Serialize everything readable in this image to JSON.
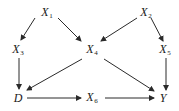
{
  "diagram": {
    "type": "causal-dag",
    "colors": {
      "edge": "#2a2a2a",
      "text": "#1a1a1a",
      "background": "#ffffff"
    },
    "nodes": [
      {
        "id": "X1",
        "base": "X",
        "sub": "1",
        "x": 47,
        "y": 13
      },
      {
        "id": "X2",
        "base": "X",
        "sub": "2",
        "x": 146,
        "y": 13
      },
      {
        "id": "X3",
        "base": "X",
        "sub": "3",
        "x": 18,
        "y": 50
      },
      {
        "id": "X4",
        "base": "X",
        "sub": "4",
        "x": 92,
        "y": 50
      },
      {
        "id": "X5",
        "base": "X",
        "sub": "5",
        "x": 165,
        "y": 50
      },
      {
        "id": "D",
        "base": "D",
        "sub": "",
        "x": 18,
        "y": 98
      },
      {
        "id": "X6",
        "base": "X",
        "sub": "6",
        "x": 92,
        "y": 98
      },
      {
        "id": "Y",
        "base": "Y",
        "sub": "",
        "x": 163,
        "y": 98
      }
    ],
    "edges": [
      {
        "from": "X1",
        "to": "X3",
        "x1": 35,
        "y1": 18,
        "x2": 21,
        "y2": 40
      },
      {
        "from": "X1",
        "to": "X4",
        "x1": 58,
        "y1": 18,
        "x2": 81,
        "y2": 41
      },
      {
        "from": "X2",
        "to": "X4",
        "x1": 137,
        "y1": 18,
        "x2": 101,
        "y2": 41
      },
      {
        "from": "X2",
        "to": "X5",
        "x1": 151,
        "y1": 18,
        "x2": 163,
        "y2": 41
      },
      {
        "from": "X3",
        "to": "D",
        "x1": 19,
        "y1": 58,
        "x2": 19,
        "y2": 89
      },
      {
        "from": "X4",
        "to": "D",
        "x1": 82,
        "y1": 59,
        "x2": 27,
        "y2": 90
      },
      {
        "from": "X4",
        "to": "Y",
        "x1": 104,
        "y1": 59,
        "x2": 154,
        "y2": 91
      },
      {
        "from": "X5",
        "to": "Y",
        "x1": 166,
        "y1": 58,
        "x2": 166,
        "y2": 90
      },
      {
        "from": "D",
        "to": "X6",
        "x1": 27,
        "y1": 98,
        "x2": 81,
        "y2": 98
      },
      {
        "from": "X6",
        "to": "Y",
        "x1": 105,
        "y1": 98,
        "x2": 154,
        "y2": 98
      }
    ]
  },
  "labels": {
    "X1": {
      "base": "X",
      "sub": "1"
    },
    "X2": {
      "base": "X",
      "sub": "2"
    },
    "X3": {
      "base": "X",
      "sub": "3"
    },
    "X4": {
      "base": "X",
      "sub": "4"
    },
    "X5": {
      "base": "X",
      "sub": "5"
    },
    "X6": {
      "base": "X",
      "sub": "6"
    },
    "D": {
      "base": "D"
    },
    "Y": {
      "base": "Y"
    }
  }
}
